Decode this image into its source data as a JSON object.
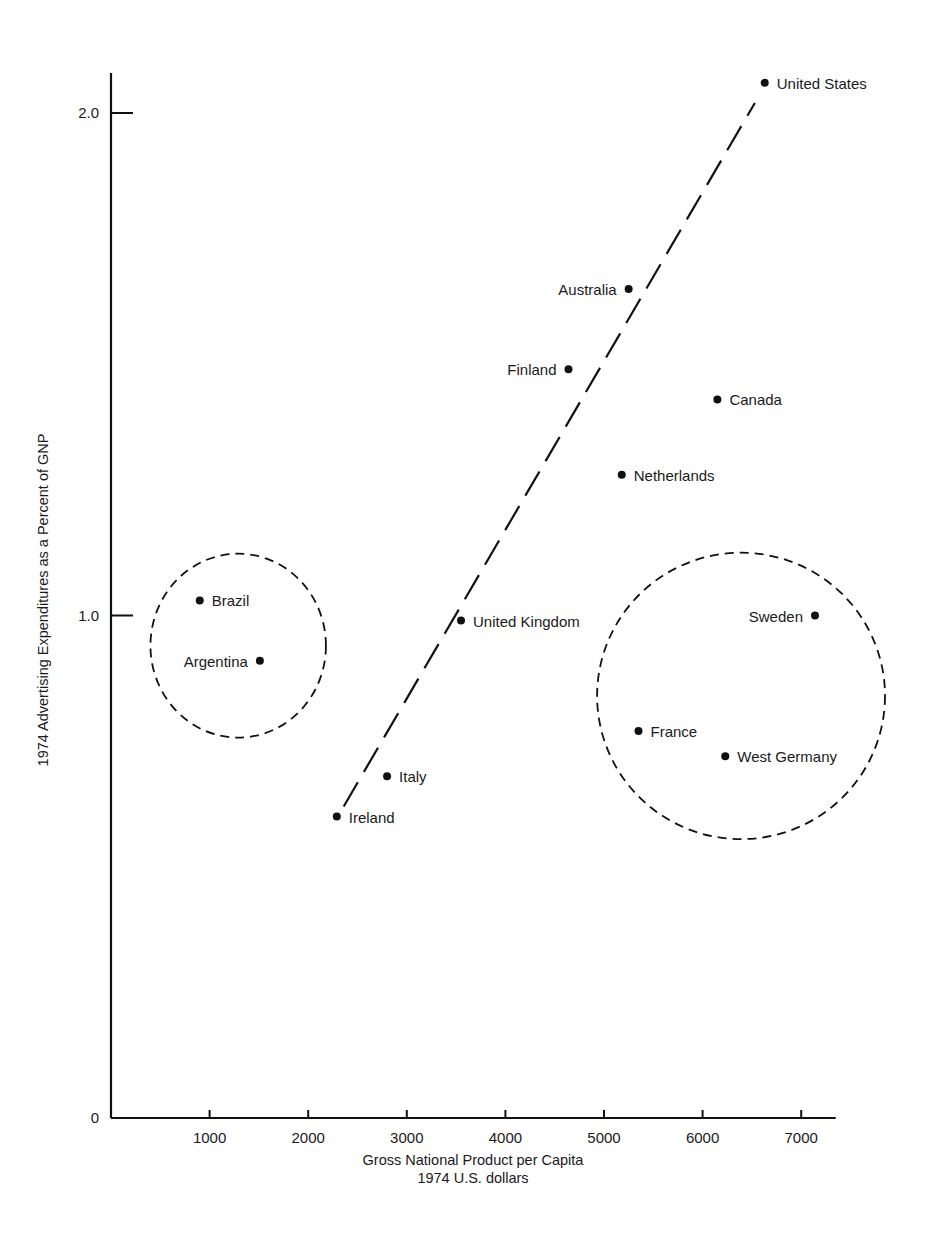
{
  "chart_data": {
    "type": "scatter",
    "title": "",
    "xlabel": "Gross National Product per Capita",
    "xlabel_sub": "1974 U.S. dollars",
    "ylabel": "1974 Advertising Expenditures as a Percent of GNP",
    "xlim": [
      0,
      7350
    ],
    "ylim": [
      0,
      2.1
    ],
    "grid": false,
    "xticks": [
      1000,
      2000,
      3000,
      4000,
      5000,
      6000,
      7000
    ],
    "xtick_labels": [
      "1000",
      "2000",
      "3000",
      "4000",
      "5000",
      "6000",
      "7000"
    ],
    "yticks": [
      0,
      1.0,
      2.0
    ],
    "ytick_labels": [
      "0",
      "1.0",
      "2.0"
    ],
    "points": [
      {
        "label": "United States",
        "x": 6630,
        "y": 2.06,
        "label_side": "right"
      },
      {
        "label": "Australia",
        "x": 5250,
        "y": 1.65,
        "label_side": "left"
      },
      {
        "label": "Finland",
        "x": 4640,
        "y": 1.49,
        "label_side": "left"
      },
      {
        "label": "Canada",
        "x": 6150,
        "y": 1.43,
        "label_side": "right"
      },
      {
        "label": "Netherlands",
        "x": 5180,
        "y": 1.28,
        "label_side": "right"
      },
      {
        "label": "Brazil",
        "x": 900,
        "y": 1.03,
        "label_side": "right"
      },
      {
        "label": "United Kingdom",
        "x": 3550,
        "y": 0.99,
        "label_side": "right"
      },
      {
        "label": "Sweden",
        "x": 7140,
        "y": 1.0,
        "label_side": "left"
      },
      {
        "label": "Argentina",
        "x": 1510,
        "y": 0.91,
        "label_side": "left"
      },
      {
        "label": "France",
        "x": 5350,
        "y": 0.77,
        "label_side": "right"
      },
      {
        "label": "West Germany",
        "x": 6230,
        "y": 0.72,
        "label_side": "right"
      },
      {
        "label": "Italy",
        "x": 2800,
        "y": 0.68,
        "label_side": "right"
      },
      {
        "label": "Ireland",
        "x": 2290,
        "y": 0.6,
        "label_side": "right"
      }
    ],
    "trend_line": {
      "style": "dashed",
      "from": {
        "x": 2360,
        "y": 0.62
      },
      "to": {
        "x": 6530,
        "y": 2.02
      }
    },
    "annotations": [
      {
        "type": "dashed-ellipse",
        "name": "low-gnp-cluster",
        "members": [
          "Brazil",
          "Argentina"
        ],
        "center": {
          "x": 1290,
          "y": 0.94
        },
        "rx_data": 890,
        "ry_data": 0.183
      },
      {
        "type": "dashed-ellipse",
        "name": "high-gnp-cluster",
        "members": [
          "Sweden",
          "France",
          "West Germany"
        ],
        "center": {
          "x": 6390,
          "y": 0.84
        },
        "rx_data": 1460,
        "ry_data": 0.285
      }
    ]
  }
}
